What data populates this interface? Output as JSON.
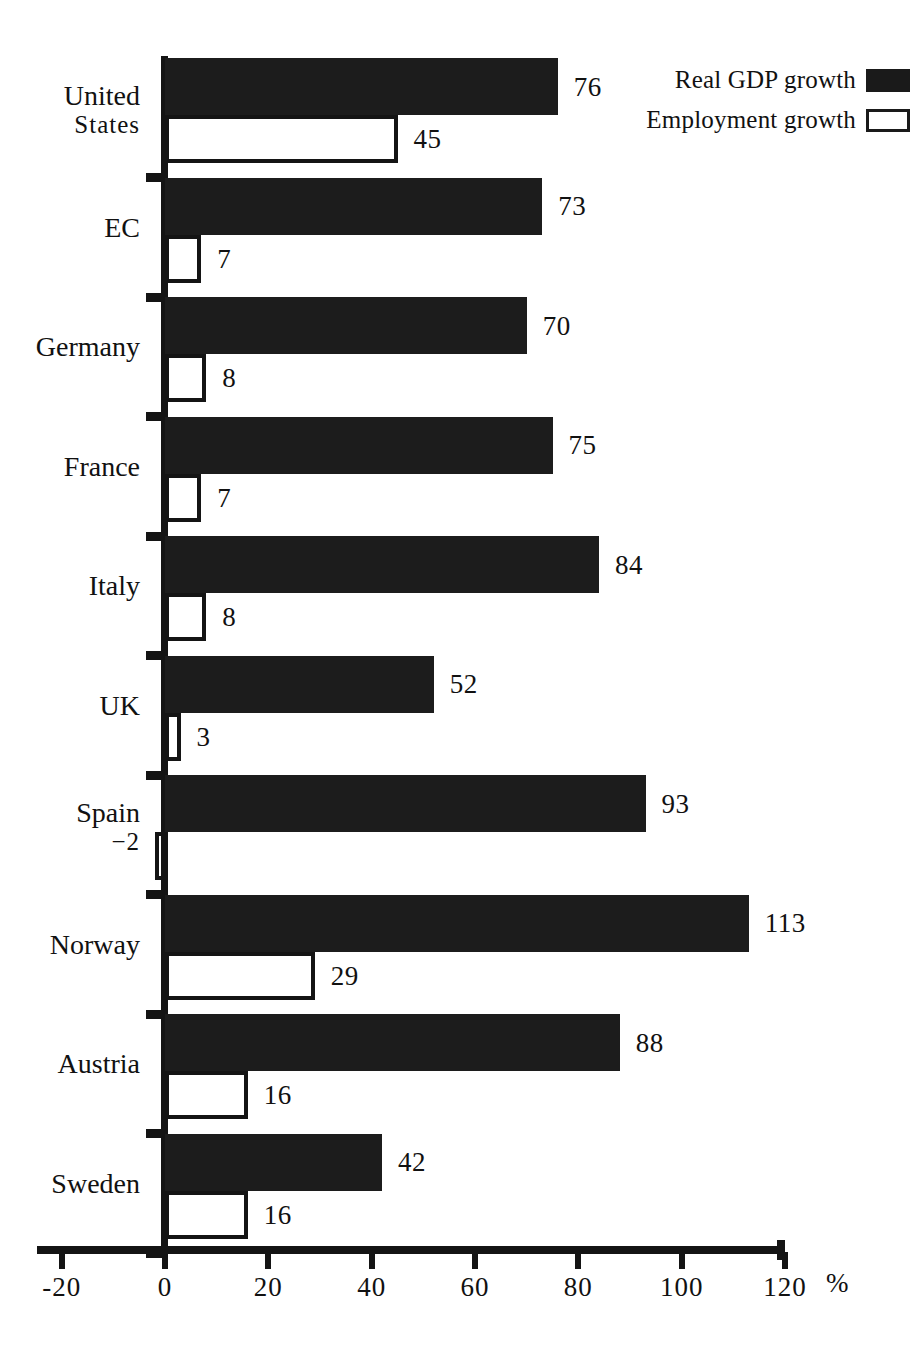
{
  "legend": {
    "items": [
      {
        "label": "Real GDP growth",
        "swatch": "filled-square-icon",
        "style": "filled"
      },
      {
        "label": "Employment growth",
        "swatch": "hollow-square-icon",
        "style": "hollow"
      }
    ]
  },
  "axis": {
    "unit": "%",
    "ticks": [
      "-20",
      "0",
      "20",
      "40",
      "60",
      "80",
      "100",
      "120"
    ],
    "tick_values": [
      -20,
      0,
      20,
      40,
      60,
      80,
      100,
      120
    ],
    "min": -20,
    "max": 120
  },
  "chart_data": {
    "type": "bar",
    "orientation": "horizontal",
    "title": "",
    "subtitle": "",
    "xlabel": "%",
    "ylabel": "",
    "xlim": [
      -20,
      120
    ],
    "grid": false,
    "legend_position": "top-right",
    "categories": [
      "United States",
      "EC",
      "Germany",
      "France",
      "Italy",
      "UK",
      "Spain",
      "Norway",
      "Austria",
      "Sweden"
    ],
    "series": [
      {
        "name": "Real GDP growth",
        "color": "#1c1c1c",
        "values": [
          76,
          73,
          70,
          75,
          84,
          52,
          93,
          113,
          88,
          42
        ],
        "labels": [
          "76",
          "73",
          "70",
          "75",
          "84",
          "52",
          "93",
          "113",
          "88",
          "42"
        ]
      },
      {
        "name": "Employment growth",
        "color": "#ffffff",
        "values": [
          45,
          7,
          8,
          7,
          8,
          3,
          -2,
          29,
          16,
          16
        ],
        "labels": [
          "45",
          "7",
          "8",
          "7",
          "8",
          "3",
          "-2",
          "29",
          "16",
          "16"
        ]
      }
    ]
  },
  "rows": [
    {
      "label": "United States",
      "label_line1": "United",
      "label_line2": "States",
      "gdp": 76,
      "gdp_label": "76",
      "emp": 45,
      "emp_label": "45"
    },
    {
      "label": "EC",
      "label_line1": "EC",
      "label_line2": "",
      "gdp": 73,
      "gdp_label": "73",
      "emp": 7,
      "emp_label": "7"
    },
    {
      "label": "Germany",
      "label_line1": "Germany",
      "label_line2": "",
      "gdp": 70,
      "gdp_label": "70",
      "emp": 8,
      "emp_label": "8"
    },
    {
      "label": "France",
      "label_line1": "France",
      "label_line2": "",
      "gdp": 75,
      "gdp_label": "75",
      "emp": 7,
      "emp_label": "7"
    },
    {
      "label": "Italy",
      "label_line1": "Italy",
      "label_line2": "",
      "gdp": 84,
      "gdp_label": "84",
      "emp": 8,
      "emp_label": "8"
    },
    {
      "label": "UK",
      "label_line1": "UK",
      "label_line2": "",
      "gdp": 52,
      "gdp_label": "52",
      "emp": 3,
      "emp_label": "3"
    },
    {
      "label": "Spain",
      "label_line1": "Spain",
      "label_line2": "−2",
      "gdp": 93,
      "gdp_label": "93",
      "emp": -2,
      "emp_label": "−2"
    },
    {
      "label": "Norway",
      "label_line1": "Norway",
      "label_line2": "",
      "gdp": 113,
      "gdp_label": "113",
      "emp": 29,
      "emp_label": "29"
    },
    {
      "label": "Austria",
      "label_line1": "Austria",
      "label_line2": "",
      "gdp": 88,
      "gdp_label": "88",
      "emp": 16,
      "emp_label": "16"
    },
    {
      "label": "Sweden",
      "label_line1": "Sweden",
      "label_line2": "",
      "gdp": 42,
      "gdp_label": "42",
      "emp": 16,
      "emp_label": "16"
    }
  ],
  "colors": {
    "ink": "#141414",
    "gdp_fill": "#1c1c1c",
    "emp_fill": "#ffffff",
    "background": "#ffffff"
  }
}
